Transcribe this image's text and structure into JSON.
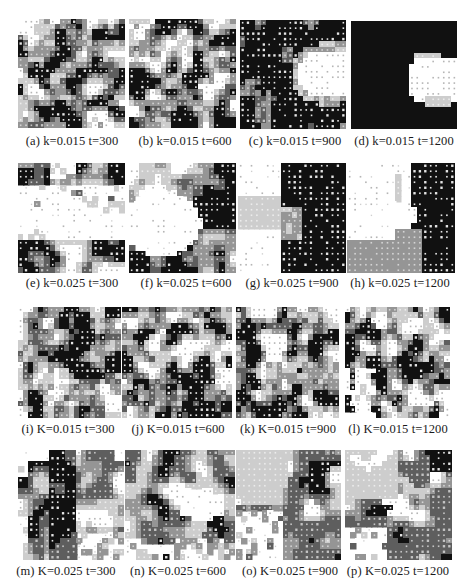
{
  "figure": {
    "grid_size": 20,
    "palette": {
      "levels": [
        "#ffffff",
        "#cdcdcd",
        "#959595",
        "#5e5e5e",
        "#111111"
      ],
      "dots": [
        "#b5b5b5",
        "#ececec",
        "#d4d4d4",
        "#c4c4c4",
        "#e6e6e6"
      ]
    },
    "panels": [
      {
        "id": "a",
        "caption": "(a) k=0.015 t=300",
        "param": "k",
        "value": 0.015,
        "t": 300,
        "pattern": "random-dense",
        "seed": 11
      },
      {
        "id": "b",
        "caption": "(b) k=0.015 t=600",
        "param": "k",
        "value": 0.015,
        "t": 600,
        "pattern": "random-clustered",
        "seed": 23
      },
      {
        "id": "c",
        "caption": "(c) k=0.015 t=900",
        "param": "k",
        "value": 0.015,
        "t": 900,
        "pattern": "black-with-blob",
        "seed": 37
      },
      {
        "id": "d",
        "caption": "(d) k=0.015 t=1200",
        "param": "k",
        "value": 0.015,
        "t": 1200,
        "pattern": "solid-black-blob",
        "seed": 41
      },
      {
        "id": "e",
        "caption": "(e) k=0.025 t=300",
        "param": "k",
        "value": 0.025,
        "t": 300,
        "pattern": "white-center",
        "seed": 53
      },
      {
        "id": "f",
        "caption": "(f) k=0.025 t=600",
        "param": "k",
        "value": 0.025,
        "t": 600,
        "pattern": "white-left-dark-right",
        "seed": 67
      },
      {
        "id": "g",
        "caption": "(g) k=0.025 t=900",
        "param": "k",
        "value": 0.025,
        "t": 900,
        "pattern": "bands-g",
        "seed": 71
      },
      {
        "id": "h",
        "caption": "(h) k=0.025 t=1200",
        "param": "k",
        "value": 0.025,
        "t": 1200,
        "pattern": "bands-h",
        "seed": 83
      },
      {
        "id": "i",
        "caption": "(i) K=0.015 t=300",
        "param": "K",
        "value": 0.015,
        "t": 300,
        "pattern": "random-dense",
        "seed": 97
      },
      {
        "id": "j",
        "caption": "(j) K=0.015 t=600",
        "param": "K",
        "value": 0.015,
        "t": 600,
        "pattern": "random-clustered",
        "seed": 101
      },
      {
        "id": "k",
        "caption": "(k) K=0.015 t=900",
        "param": "K",
        "value": 0.015,
        "t": 900,
        "pattern": "random-clustered",
        "seed": 113
      },
      {
        "id": "l",
        "caption": "(l) K=0.015 t=1200",
        "param": "K",
        "value": 0.015,
        "t": 1200,
        "pattern": "random-sparse-left",
        "seed": 127
      },
      {
        "id": "m",
        "caption": "(m) K=0.025 t=300",
        "param": "K",
        "value": 0.025,
        "t": 300,
        "pattern": "irregular-m",
        "seed": 131
      },
      {
        "id": "n",
        "caption": "(n) K=0.025 t=600",
        "param": "K",
        "value": 0.025,
        "t": 600,
        "pattern": "irregular-n",
        "seed": 149
      },
      {
        "id": "o",
        "caption": "(o) K=0.025 t=900",
        "param": "K",
        "value": 0.025,
        "t": 900,
        "pattern": "irregular-o",
        "seed": 157
      },
      {
        "id": "p",
        "caption": "(p) K=0.025 t=1200",
        "param": "K",
        "value": 0.025,
        "t": 1200,
        "pattern": "irregular-p",
        "seed": 163
      }
    ]
  }
}
